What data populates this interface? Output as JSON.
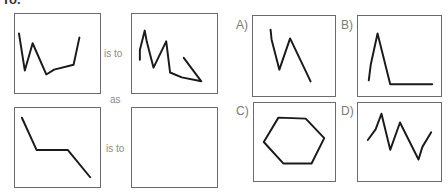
{
  "header": {
    "fragment": "To."
  },
  "question": {
    "is_to_1": "is to",
    "as": "as",
    "is_to_2": "is to"
  },
  "options": [
    {
      "label": "A)"
    },
    {
      "label": "B)"
    },
    {
      "label": "C)"
    },
    {
      "label": "D)"
    }
  ]
}
